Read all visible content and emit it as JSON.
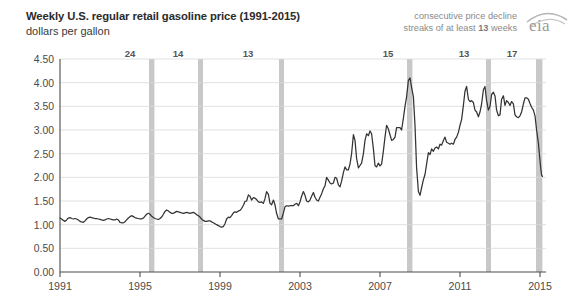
{
  "header": {
    "title": "Weekly U.S. regular retail gasoline price (1991-2015)",
    "subtitle": "dollars per gallon",
    "note_line1": "consecutive price decline",
    "note_line2_prefix": "streaks of at least ",
    "note_line2_bold": "13",
    "note_line2_suffix": " weeks",
    "logo_text": "eia"
  },
  "chart_data": {
    "type": "line",
    "title": "Weekly U.S. regular retail gasoline price (1991-2015)",
    "subtitle": "dollars per gallon",
    "xlabel": "",
    "ylabel": "dollars per gallon",
    "xlim": [
      1991,
      2015.3
    ],
    "ylim": [
      0.0,
      4.5
    ],
    "grid": true,
    "legend_position": "none",
    "line_color": "#333333",
    "band_color": "#c8c8c8",
    "ytick_labels": [
      "4.50",
      "4.00",
      "3.50",
      "3.00",
      "2.50",
      "2.00",
      "1.50",
      "1.00",
      "0.50",
      "0.00"
    ],
    "ytick_values": [
      4.5,
      4.0,
      3.5,
      3.0,
      2.5,
      2.0,
      1.5,
      1.0,
      0.5,
      0.0
    ],
    "xtick_labels": [
      "1991",
      "1995",
      "1999",
      "2003",
      "2007",
      "2011",
      "2015"
    ],
    "xtick_values": [
      1991,
      1995,
      1999,
      2003,
      2007,
      2011,
      2015
    ],
    "annotation_bands": [
      {
        "label": "24",
        "start": 1995.45,
        "end": 1995.72,
        "label_x": 1994.5
      },
      {
        "label": "14",
        "start": 1997.9,
        "end": 1998.15,
        "label_x": 1996.9
      },
      {
        "label": "13",
        "start": 2001.95,
        "end": 2002.2,
        "label_x": 2000.4
      },
      {
        "label": "15",
        "start": 2008.35,
        "end": 2008.62,
        "label_x": 2007.4
      },
      {
        "label": "13",
        "start": 2012.3,
        "end": 2012.55,
        "label_x": 2011.2
      },
      {
        "label": "17",
        "start": 2014.8,
        "end": 2015.12,
        "label_x": 2013.6
      }
    ],
    "series": [
      {
        "name": "Weekly U.S. regular retail gasoline price",
        "x": [
          1991.0,
          1991.08,
          1991.17,
          1991.25,
          1991.33,
          1991.42,
          1991.5,
          1991.58,
          1991.67,
          1991.75,
          1991.83,
          1991.92,
          1992.0,
          1992.08,
          1992.17,
          1992.25,
          1992.33,
          1992.42,
          1992.5,
          1992.58,
          1992.67,
          1992.75,
          1992.83,
          1992.92,
          1993.0,
          1993.08,
          1993.17,
          1993.25,
          1993.33,
          1993.42,
          1993.5,
          1993.58,
          1993.67,
          1993.75,
          1993.83,
          1993.92,
          1994.0,
          1994.08,
          1994.17,
          1994.25,
          1994.33,
          1994.42,
          1994.5,
          1994.58,
          1994.67,
          1994.75,
          1994.83,
          1994.92,
          1995.0,
          1995.08,
          1995.17,
          1995.25,
          1995.33,
          1995.42,
          1995.5,
          1995.58,
          1995.67,
          1995.75,
          1995.83,
          1995.92,
          1996.0,
          1996.08,
          1996.17,
          1996.25,
          1996.33,
          1996.42,
          1996.5,
          1996.58,
          1996.67,
          1996.75,
          1996.83,
          1996.92,
          1997.0,
          1997.08,
          1997.17,
          1997.25,
          1997.33,
          1997.42,
          1997.5,
          1997.58,
          1997.67,
          1997.75,
          1997.83,
          1997.92,
          1998.0,
          1998.08,
          1998.17,
          1998.25,
          1998.33,
          1998.42,
          1998.5,
          1998.58,
          1998.67,
          1998.75,
          1998.83,
          1998.92,
          1999.0,
          1999.08,
          1999.17,
          1999.25,
          1999.33,
          1999.42,
          1999.5,
          1999.58,
          1999.67,
          1999.75,
          1999.83,
          1999.92,
          2000.0,
          2000.08,
          2000.17,
          2000.25,
          2000.33,
          2000.42,
          2000.5,
          2000.58,
          2000.67,
          2000.75,
          2000.83,
          2000.92,
          2001.0,
          2001.08,
          2001.17,
          2001.25,
          2001.33,
          2001.42,
          2001.5,
          2001.58,
          2001.67,
          2001.75,
          2001.83,
          2001.92,
          2002.0,
          2002.08,
          2002.17,
          2002.25,
          2002.33,
          2002.42,
          2002.5,
          2002.58,
          2002.67,
          2002.75,
          2002.83,
          2002.92,
          2003.0,
          2003.08,
          2003.17,
          2003.25,
          2003.33,
          2003.42,
          2003.5,
          2003.58,
          2003.67,
          2003.75,
          2003.83,
          2003.92,
          2004.0,
          2004.08,
          2004.17,
          2004.25,
          2004.33,
          2004.42,
          2004.5,
          2004.58,
          2004.67,
          2004.75,
          2004.83,
          2004.92,
          2005.0,
          2005.08,
          2005.17,
          2005.25,
          2005.33,
          2005.42,
          2005.5,
          2005.58,
          2005.67,
          2005.75,
          2005.83,
          2005.92,
          2006.0,
          2006.08,
          2006.17,
          2006.25,
          2006.33,
          2006.42,
          2006.5,
          2006.58,
          2006.67,
          2006.75,
          2006.83,
          2006.92,
          2007.0,
          2007.08,
          2007.17,
          2007.25,
          2007.33,
          2007.42,
          2007.5,
          2007.58,
          2007.67,
          2007.75,
          2007.83,
          2007.92,
          2008.0,
          2008.08,
          2008.17,
          2008.25,
          2008.33,
          2008.42,
          2008.5,
          2008.54,
          2008.58,
          2008.67,
          2008.75,
          2008.83,
          2008.92,
          2009.0,
          2009.08,
          2009.17,
          2009.25,
          2009.33,
          2009.42,
          2009.5,
          2009.58,
          2009.67,
          2009.75,
          2009.83,
          2009.92,
          2010.0,
          2010.08,
          2010.17,
          2010.25,
          2010.33,
          2010.42,
          2010.5,
          2010.58,
          2010.67,
          2010.75,
          2010.83,
          2010.92,
          2011.0,
          2011.08,
          2011.17,
          2011.25,
          2011.33,
          2011.42,
          2011.5,
          2011.58,
          2011.67,
          2011.75,
          2011.83,
          2011.92,
          2012.0,
          2012.08,
          2012.17,
          2012.25,
          2012.33,
          2012.42,
          2012.5,
          2012.58,
          2012.67,
          2012.75,
          2012.83,
          2012.92,
          2013.0,
          2013.08,
          2013.17,
          2013.25,
          2013.33,
          2013.42,
          2013.5,
          2013.58,
          2013.67,
          2013.75,
          2013.83,
          2013.92,
          2014.0,
          2014.08,
          2014.17,
          2014.25,
          2014.33,
          2014.42,
          2014.5,
          2014.58,
          2014.67,
          2014.75,
          2014.83,
          2014.92,
          2015.0,
          2015.04,
          2015.08,
          2015.12
        ],
        "y": [
          1.14,
          1.12,
          1.09,
          1.07,
          1.1,
          1.14,
          1.15,
          1.13,
          1.12,
          1.13,
          1.12,
          1.1,
          1.07,
          1.06,
          1.05,
          1.08,
          1.12,
          1.15,
          1.16,
          1.15,
          1.14,
          1.13,
          1.13,
          1.12,
          1.11,
          1.1,
          1.09,
          1.1,
          1.12,
          1.13,
          1.12,
          1.11,
          1.1,
          1.1,
          1.12,
          1.1,
          1.05,
          1.04,
          1.04,
          1.06,
          1.1,
          1.14,
          1.17,
          1.19,
          1.17,
          1.15,
          1.14,
          1.13,
          1.12,
          1.12,
          1.14,
          1.18,
          1.22,
          1.24,
          1.22,
          1.18,
          1.15,
          1.13,
          1.12,
          1.11,
          1.13,
          1.16,
          1.22,
          1.28,
          1.31,
          1.29,
          1.26,
          1.24,
          1.24,
          1.26,
          1.28,
          1.27,
          1.26,
          1.25,
          1.24,
          1.25,
          1.26,
          1.25,
          1.24,
          1.25,
          1.26,
          1.24,
          1.21,
          1.19,
          1.16,
          1.12,
          1.09,
          1.07,
          1.07,
          1.08,
          1.08,
          1.06,
          1.04,
          1.02,
          1.0,
          0.98,
          0.96,
          0.95,
          0.96,
          1.02,
          1.12,
          1.16,
          1.15,
          1.19,
          1.25,
          1.27,
          1.26,
          1.29,
          1.3,
          1.34,
          1.41,
          1.49,
          1.5,
          1.63,
          1.6,
          1.52,
          1.57,
          1.56,
          1.53,
          1.48,
          1.47,
          1.48,
          1.45,
          1.55,
          1.7,
          1.64,
          1.45,
          1.42,
          1.52,
          1.42,
          1.24,
          1.12,
          1.12,
          1.12,
          1.25,
          1.38,
          1.4,
          1.39,
          1.4,
          1.4,
          1.4,
          1.43,
          1.45,
          1.4,
          1.48,
          1.6,
          1.7,
          1.62,
          1.5,
          1.48,
          1.52,
          1.6,
          1.68,
          1.58,
          1.52,
          1.5,
          1.58,
          1.65,
          1.76,
          1.82,
          2.0,
          1.94,
          1.88,
          1.86,
          1.88,
          2.0,
          1.98,
          1.84,
          1.8,
          1.92,
          2.1,
          2.22,
          2.16,
          2.16,
          2.28,
          2.5,
          2.9,
          2.78,
          2.4,
          2.2,
          2.25,
          2.3,
          2.5,
          2.78,
          2.92,
          2.88,
          2.98,
          2.92,
          2.6,
          2.25,
          2.22,
          2.3,
          2.24,
          2.28,
          2.56,
          2.85,
          3.1,
          3.02,
          2.9,
          2.78,
          2.8,
          2.85,
          3.05,
          3.05,
          3.05,
          3.0,
          3.25,
          3.5,
          3.7,
          4.05,
          4.1,
          4.0,
          3.9,
          3.7,
          3.1,
          2.2,
          1.7,
          1.62,
          1.78,
          1.95,
          2.06,
          2.28,
          2.52,
          2.48,
          2.6,
          2.55,
          2.62,
          2.64,
          2.6,
          2.7,
          2.68,
          2.78,
          2.85,
          2.74,
          2.72,
          2.7,
          2.72,
          2.7,
          2.8,
          2.85,
          2.95,
          3.1,
          3.22,
          3.52,
          3.82,
          3.92,
          3.65,
          3.6,
          3.62,
          3.58,
          3.42,
          3.38,
          3.28,
          3.38,
          3.55,
          3.85,
          3.92,
          3.62,
          3.42,
          3.5,
          3.75,
          3.8,
          3.72,
          3.42,
          3.3,
          3.32,
          3.65,
          3.72,
          3.52,
          3.62,
          3.58,
          3.52,
          3.6,
          3.55,
          3.32,
          3.28,
          3.26,
          3.3,
          3.38,
          3.55,
          3.68,
          3.68,
          3.65,
          3.56,
          3.48,
          3.42,
          3.3,
          3.0,
          2.72,
          2.35,
          2.18,
          2.05,
          2.02
        ]
      }
    ]
  }
}
